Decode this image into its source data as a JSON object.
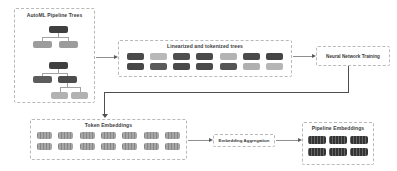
{
  "diagram": {
    "automl": {
      "title": "AutoML Pipeline Trees",
      "tree1": {
        "root": "#3f3f3f",
        "left_child": "#9c9c9c",
        "right_child": "#9c9c9c"
      },
      "tree2": {
        "root": "#3f3f3f",
        "left_child": "#5c5c5c",
        "right_child": "#4d4d4d",
        "left_grandchild": "#b2b2b2",
        "right_grandchild": "#b2b2b2"
      }
    },
    "linearized": {
      "title": "Linearized and tokenized trees",
      "token_rows": [
        [
          "#4a4a4a",
          "#b8b8b8",
          "#4f4f4f",
          "#4a4a4a",
          "#b3b3b3",
          "#4a4a4a",
          "#454545"
        ],
        [
          "#474747",
          "#5a5a5a",
          "#4a4a4a",
          "#4a4a4a",
          "#555555",
          "#b0b0b0",
          "#b5b5b5"
        ]
      ]
    },
    "nn_training": {
      "label": "Neural Network Training"
    },
    "token_embeddings": {
      "title": "Token Embeddings",
      "pill_rows": [
        [
          "#9e9e9e",
          "#9e9e9e",
          "#9e9e9e",
          "#9e9e9e",
          "#9e9e9e",
          "#9e9e9e",
          "#9e9e9e"
        ],
        [
          "#9e9e9e",
          "#9e9e9e",
          "#9e9e9e",
          "#9e9e9e",
          "#9e9e9e",
          "#9e9e9e",
          "#9e9e9e"
        ]
      ]
    },
    "embedding_aggregation": {
      "label": "Embedding Aggregation"
    },
    "pipeline_embeddings": {
      "title": "Pipeline Embeddings",
      "pill_rows": [
        [
          "#3a3a3a",
          "#3a3a3a",
          "#3a3a3a"
        ],
        [
          "#3a3a3a",
          "#3a3a3a",
          "#3a3a3a"
        ]
      ]
    }
  }
}
